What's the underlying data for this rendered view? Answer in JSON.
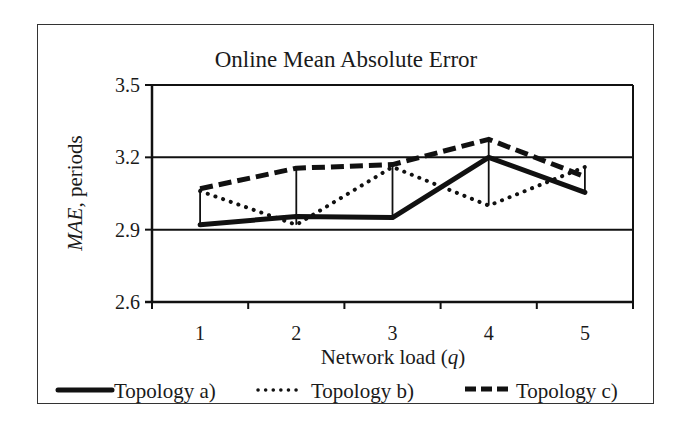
{
  "chart_data": {
    "type": "line",
    "title": "Online Mean Absolute Error",
    "xlabel": "Network load (q)",
    "xlabel_parts": {
      "prefix": "Network load (",
      "var": "q",
      "suffix": ")"
    },
    "ylabel": "MAE, periods",
    "ylabel_parts": {
      "var": "MAE",
      "suffix": ", periods"
    },
    "categories": [
      "1",
      "2",
      "3",
      "4",
      "5"
    ],
    "ylim": [
      2.6,
      3.5
    ],
    "yticks": [
      "2.6",
      "2.9",
      "3.2",
      "3.5"
    ],
    "ytick_values": [
      2.6,
      2.9,
      3.2,
      3.5
    ],
    "grid": {
      "horizontal": true,
      "vertical": false
    },
    "hi_low_lines": true,
    "legend_position": "bottom",
    "series": [
      {
        "name": "Topology a)",
        "style": "solid",
        "values": [
          2.92,
          2.955,
          2.95,
          3.2,
          3.055
        ]
      },
      {
        "name": "Topology b)",
        "style": "dotted",
        "values": [
          3.06,
          2.92,
          3.16,
          3.0,
          3.16
        ]
      },
      {
        "name": "Topology c)",
        "style": "dashed",
        "values": [
          3.07,
          3.155,
          3.17,
          3.275,
          3.12
        ]
      }
    ]
  },
  "colors": {
    "line": "#111111",
    "grid": "#111111",
    "frame": "#333333",
    "background": "#ffffff"
  }
}
